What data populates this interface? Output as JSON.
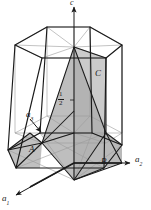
{
  "figure": {
    "type": "hexagonal-unit-cell-diagram",
    "colors": {
      "line": "#1a1a1a",
      "line_light": "#8a8a8a",
      "shade_fill": "#b9b9b9",
      "shade_fill_dark": "#a0a0a0",
      "background": "#ffffff"
    }
  },
  "axes": [
    {
      "id": "c",
      "label": "c",
      "sub": "",
      "x": 74,
      "y": 0,
      "direction": "up"
    },
    {
      "id": "a1",
      "label": "a",
      "sub": "1",
      "x": 3,
      "y": 196,
      "direction": "down-left"
    },
    {
      "id": "a2",
      "label": "a",
      "sub": "2",
      "x": 136,
      "y": 156,
      "direction": "right"
    },
    {
      "id": "a3",
      "label": "a",
      "sub": "3",
      "x": 27,
      "y": 113,
      "direction": "down-right"
    }
  ],
  "points": [
    {
      "id": "A",
      "label": "A",
      "x": 30,
      "y": 148
    },
    {
      "id": "B",
      "label": "B",
      "x": 102,
      "y": 160
    },
    {
      "id": "C",
      "label": "C",
      "x": 96,
      "y": 72
    }
  ],
  "annotations": [
    {
      "id": "half-intercept",
      "numerator": "1",
      "denominator": "2",
      "x": 58,
      "y": 92
    }
  ]
}
